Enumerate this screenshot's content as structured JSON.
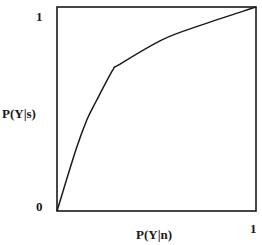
{
  "chart_data": {
    "type": "line",
    "title": "",
    "xlabel": "P(Y|n)",
    "ylabel": "P(Y|s)",
    "xlim": [
      0,
      1
    ],
    "ylim": [
      0,
      1
    ],
    "grid": false,
    "legend": null,
    "x_ticks": [
      "0",
      "1"
    ],
    "y_ticks": [
      "0",
      "1"
    ],
    "series": [
      {
        "name": "curve",
        "x": [
          0,
          0.095,
          0.15,
          0.2,
          0.28,
          0.31,
          0.53,
          0.72,
          1.0
        ],
        "y": [
          0,
          0.3,
          0.446,
          0.544,
          0.69,
          0.716,
          0.84,
          0.91,
          1.0
        ]
      }
    ]
  },
  "labels": {
    "y_top": "1",
    "origin": "0",
    "x_right": "1",
    "ylabel": "P(Y|s)",
    "xlabel": "P(Y|n)"
  },
  "colors": {
    "line": "#1a1a1a",
    "frame": "#1a1a1a",
    "background": "#ffffff"
  }
}
